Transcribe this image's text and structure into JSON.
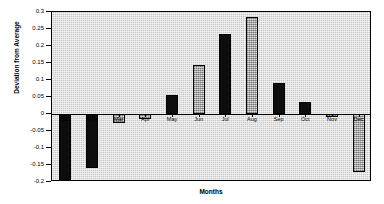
{
  "chart_data": {
    "type": "bar",
    "title": "",
    "xlabel": "Months",
    "ylabel": "Deviation from Average",
    "categories": [
      "Jan",
      "Feb",
      "Mar",
      "Apr",
      "May",
      "Jun",
      "Jul",
      "Aug",
      "Sep",
      "Oct",
      "Nov",
      "Dec"
    ],
    "values": [
      -0.195,
      -0.16,
      -0.025,
      -0.015,
      0.055,
      0.145,
      0.235,
      0.285,
      0.09,
      0.035,
      -0.01,
      -0.17
    ],
    "ylim": [
      -0.2,
      0.3
    ],
    "ytick_labels": [
      "0.3",
      "0.25",
      "0.2",
      "0.15",
      "0.1",
      "0.05",
      "0",
      "-0.05",
      "-0.1",
      "-0.15",
      "-0.2"
    ],
    "ytick_values": [
      0.3,
      0.25,
      0.2,
      0.15,
      0.1,
      0.05,
      0,
      -0.05,
      -0.1,
      -0.15,
      -0.2
    ],
    "grid": false,
    "legend": "none",
    "series_styles": [
      "dark",
      "dark",
      "light",
      "light",
      "dark",
      "light",
      "dark",
      "light",
      "dark",
      "dark",
      "light",
      "light"
    ],
    "colors": {
      "plot_background": "#c8c8c8",
      "page_background": "#ffffff",
      "axis": "#000000",
      "bar_dark": "#0d0d0d",
      "bar_light": "#b4b4b4"
    }
  }
}
